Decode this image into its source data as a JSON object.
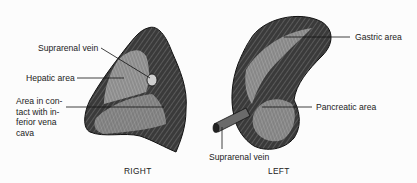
{
  "figure": {
    "panels": [
      {
        "id": "right",
        "caption": "RIGHT",
        "labels": {
          "suprarenal_vein": "Suprarenal vein",
          "hepatic_area": "Hepatic area",
          "ivc_area": "Area in con-\ntact with in-\nferior vena\ncava"
        }
      },
      {
        "id": "left",
        "caption": "LEFT",
        "labels": {
          "gastric_area": "Gastric area",
          "pancreatic_area": "Pancreatic area",
          "suprarenal_vein": "Suprarenal vein"
        }
      }
    ],
    "colors": {
      "organ_dark": "#2a2a2a",
      "organ_mid": "#6e6e6e",
      "organ_light": "#bdbdbd",
      "leader_line": "#111111"
    }
  }
}
